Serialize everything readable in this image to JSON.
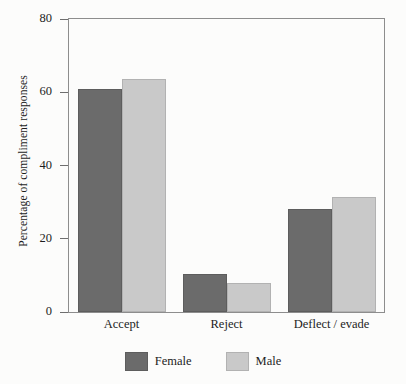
{
  "chart_data": {
    "type": "bar",
    "title": "",
    "subtitle": "",
    "xlabel": "",
    "ylabel": "Percentage of compliment responses",
    "categories": [
      "Accept",
      "Reject",
      "Deflect / evade"
    ],
    "series": [
      {
        "name": "Female",
        "color": "#6b6b6b",
        "values": [
          61,
          10.5,
          28
        ]
      },
      {
        "name": "Male",
        "color": "#c9c9c9",
        "values": [
          63.5,
          8,
          31.5
        ]
      }
    ],
    "ylim": [
      0,
      80
    ],
    "yticks": [
      0,
      20,
      40,
      60,
      80
    ],
    "ytick_labels": [
      "0",
      "20",
      "40",
      "60",
      "80"
    ],
    "grid": false,
    "legend_position": "bottom",
    "frame": "box",
    "annotations": []
  },
  "axes": {
    "y_title": "Percentage of compliment responses",
    "y_ticks": [
      {
        "value": 80,
        "label": "80"
      },
      {
        "value": 60,
        "label": "60"
      },
      {
        "value": 40,
        "label": "40"
      },
      {
        "value": 20,
        "label": "20"
      },
      {
        "value": 0,
        "label": "0"
      }
    ],
    "x_categories": [
      {
        "label": "Accept"
      },
      {
        "label": "Reject"
      },
      {
        "label": "Deflect / evade"
      }
    ]
  },
  "legend": {
    "items": [
      {
        "label": "Female",
        "color": "#6b6b6b"
      },
      {
        "label": "Male",
        "color": "#c9c9c9"
      }
    ]
  },
  "colors": {
    "female": "#6b6b6b",
    "male": "#c9c9c9",
    "axis": "#8d8d8d",
    "text": "#1d1d1d",
    "background": "#fcfcfb"
  }
}
